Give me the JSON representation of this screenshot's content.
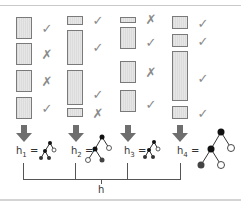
{
  "diagram": {
    "columns": [
      {
        "id": 1,
        "items": [
          {
            "top": 17,
            "height": 21,
            "mark": "✓"
          },
          {
            "top": 43,
            "height": 21,
            "mark": "✗"
          },
          {
            "top": 70,
            "height": 21,
            "mark": "✗"
          },
          {
            "top": 97,
            "height": 21,
            "mark": "✓"
          }
        ],
        "label": "h",
        "subscript": "1",
        "equals": "="
      },
      {
        "id": 2,
        "items": [
          {
            "top": 16,
            "height": 9,
            "mark": "✓"
          },
          {
            "top": 30,
            "height": 35,
            "mark": "✓"
          },
          {
            "top": 70,
            "height": 35,
            "mark": "✓"
          },
          {
            "top": 108,
            "height": 9,
            "mark": "✗"
          }
        ],
        "label": "h",
        "subscript": "2",
        "equals": "="
      },
      {
        "id": 3,
        "items": [
          {
            "top": 17,
            "height": 6,
            "mark": "✗"
          },
          {
            "top": 27,
            "height": 22,
            "mark": "✓"
          },
          {
            "top": 61,
            "height": 22,
            "mark": "✗"
          },
          {
            "top": 90,
            "height": 22,
            "mark": "✓"
          }
        ],
        "label": "h",
        "subscript": "3",
        "equals": "="
      },
      {
        "id": 4,
        "items": [
          {
            "top": 16,
            "height": 13,
            "mark": "✓"
          },
          {
            "top": 34,
            "height": 13,
            "mark": "✓"
          },
          {
            "top": 51,
            "height": 50,
            "mark": "✓"
          },
          {
            "top": 106,
            "height": 13,
            "mark": "✓"
          }
        ],
        "label": "h",
        "subscript": "4",
        "equals": "="
      }
    ],
    "combined_label": "h",
    "colors": {
      "box_border": "#7a7a7a",
      "box_fill": "#e0e0e0",
      "mark": "#8a8a8a",
      "arrow": "#6e6e6e",
      "node_black": "#111111",
      "node_dark": "#444444",
      "node_white": "#ffffff",
      "line": "#555555"
    }
  }
}
